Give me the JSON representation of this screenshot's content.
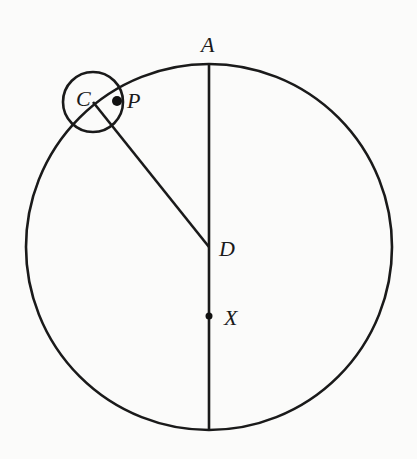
{
  "diagram": {
    "type": "geometry",
    "labels": {
      "A": "A",
      "C": "C",
      "P": "P",
      "D": "D",
      "X": "X"
    },
    "colors": {
      "ink": "#1a1a1a",
      "background": "#fbfbfa"
    },
    "elements": {
      "big_circle": {
        "cx": 209,
        "cy": 247,
        "r": 183
      },
      "small_circle": {
        "cx": 93,
        "cy": 102,
        "r": 30
      },
      "diameter_line": {
        "x1": 209,
        "y1": 64,
        "x2": 209,
        "y2": 430
      },
      "radius_line_CD": {
        "x1": 93,
        "y1": 102,
        "x2": 209,
        "y2": 247
      },
      "point_P": {
        "cx": 117,
        "cy": 101,
        "r": 5
      },
      "point_X": {
        "cx": 209,
        "cy": 316,
        "r": 3.5
      }
    }
  }
}
